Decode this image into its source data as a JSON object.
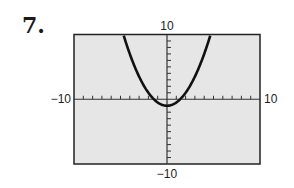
{
  "problem": {
    "number_label": "7."
  },
  "chart_data": {
    "type": "line",
    "title": "",
    "xlabel": "",
    "ylabel": "",
    "xlim": [
      -10,
      10
    ],
    "ylim": [
      -10,
      10
    ],
    "x_tick_step": 1,
    "y_tick_step": 1,
    "tick_labels": {
      "x_min": "−10",
      "x_max": "10",
      "y_min": "−10",
      "y_max": "10"
    },
    "grid": false,
    "background": "#e6e6e6",
    "series": [
      {
        "name": "parabola",
        "equation": "y = 0.5x^2 - 1",
        "vertex": [
          0,
          -1
        ],
        "x": [
          -4.7,
          -4,
          -3,
          -2,
          -1,
          0,
          1,
          2,
          3,
          4,
          4.7
        ],
        "y": [
          10.0,
          7,
          3.5,
          1,
          -0.5,
          -1,
          -0.5,
          1,
          3.5,
          7,
          10.0
        ]
      }
    ]
  }
}
